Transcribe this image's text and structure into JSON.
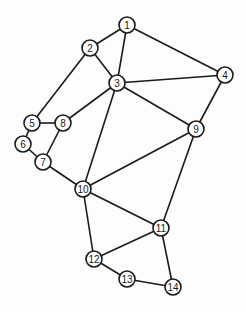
{
  "graph": {
    "node_radius": 8,
    "colors": {
      "stroke": "#1a1a1a",
      "fill": "#ffffff",
      "background": "#fdfdfd"
    },
    "nodes": [
      {
        "id": "1",
        "label": "1",
        "x": 127,
        "y": 25
      },
      {
        "id": "2",
        "label": "2",
        "x": 90,
        "y": 48
      },
      {
        "id": "3",
        "label": "3",
        "x": 117,
        "y": 83
      },
      {
        "id": "4",
        "label": "4",
        "x": 225,
        "y": 75
      },
      {
        "id": "5",
        "label": "5",
        "x": 32,
        "y": 123
      },
      {
        "id": "6",
        "label": "6",
        "x": 23,
        "y": 144
      },
      {
        "id": "7",
        "label": "7",
        "x": 43,
        "y": 162
      },
      {
        "id": "8",
        "label": "8",
        "x": 63,
        "y": 123
      },
      {
        "id": "9",
        "label": "9",
        "x": 196,
        "y": 129
      },
      {
        "id": "10",
        "label": "10",
        "x": 83,
        "y": 189
      },
      {
        "id": "11",
        "label": "11",
        "x": 161,
        "y": 228
      },
      {
        "id": "12",
        "label": "12",
        "x": 94,
        "y": 259
      },
      {
        "id": "13",
        "label": "13",
        "x": 127,
        "y": 279
      },
      {
        "id": "14",
        "label": "14",
        "x": 173,
        "y": 287
      }
    ],
    "edges": [
      [
        "1",
        "2"
      ],
      [
        "1",
        "3"
      ],
      [
        "1",
        "4"
      ],
      [
        "2",
        "3"
      ],
      [
        "2",
        "5"
      ],
      [
        "3",
        "4"
      ],
      [
        "3",
        "8"
      ],
      [
        "3",
        "9"
      ],
      [
        "3",
        "10"
      ],
      [
        "4",
        "9"
      ],
      [
        "5",
        "8"
      ],
      [
        "5",
        "6"
      ],
      [
        "6",
        "7"
      ],
      [
        "7",
        "8"
      ],
      [
        "7",
        "10"
      ],
      [
        "9",
        "10"
      ],
      [
        "9",
        "11"
      ],
      [
        "10",
        "11"
      ],
      [
        "10",
        "12"
      ],
      [
        "11",
        "12"
      ],
      [
        "11",
        "14"
      ],
      [
        "12",
        "13"
      ],
      [
        "13",
        "14"
      ]
    ]
  }
}
